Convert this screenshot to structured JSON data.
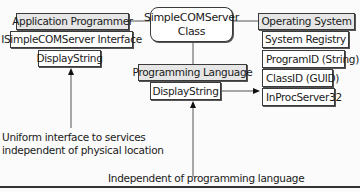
{
  "class_box": {
    "line1": "SimpleCOMServer",
    "line2": "Class"
  },
  "left_stack": {
    "title": "Application Programmer",
    "interface": "ISimpleCOMServer Interface",
    "method": "DisplayString"
  },
  "middle_stack": {
    "title": "Programming Language",
    "method": "DisplayString"
  },
  "right_stack": {
    "title": "Operating System",
    "registry": "System Registry",
    "entries": [
      "ProgramID (String)",
      "ClassID (GUID)",
      "InProcServer32"
    ]
  },
  "annotations": {
    "uniform_line1": "Uniform interface to services",
    "uniform_line2": "independent of physical location",
    "language": "Independent of programming language"
  }
}
